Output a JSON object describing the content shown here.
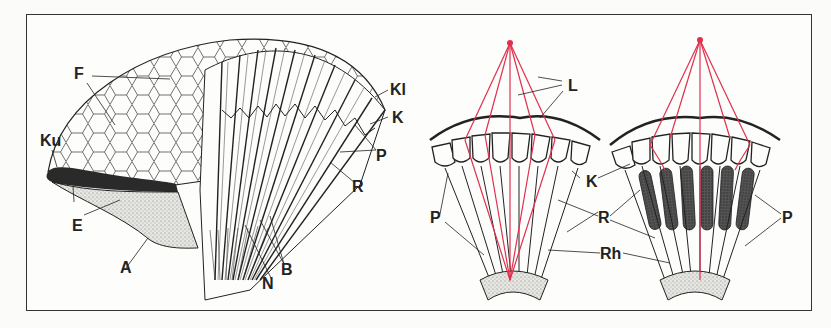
{
  "figure": {
    "panels": [
      {
        "id": "compound-eye-cutaway",
        "labels": {
          "F": "F",
          "Ku": "Ku",
          "E": "E",
          "A": "A",
          "N": "N",
          "B": "B",
          "Kl": "Kl",
          "K": "K",
          "P": "P",
          "R": "R"
        }
      },
      {
        "id": "apposition-eye",
        "labels": {
          "L": "L",
          "K": "K",
          "P": "P",
          "R": "R",
          "Rh": "Rh"
        }
      },
      {
        "id": "superposition-eye",
        "labels": {
          "P": "P"
        }
      }
    ],
    "colors": {
      "light_rays": "#e0304e",
      "ink": "#222222",
      "frame": "#333333",
      "background": "#fdfdfb"
    }
  }
}
